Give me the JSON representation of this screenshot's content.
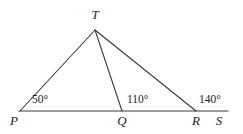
{
  "figure": {
    "type": "geometry-diagram",
    "background_color": "#ffffff",
    "stroke_color": "#3a3a3a",
    "text_color": "#1d1d1d",
    "vertices": [
      {
        "name": "T",
        "label": "T",
        "x": 95,
        "y": 30,
        "label_x": 95,
        "label_y": 14
      },
      {
        "name": "P",
        "label": "P",
        "x": 20,
        "y": 111,
        "label_x": 14,
        "label_y": 120
      },
      {
        "name": "Q",
        "label": "Q",
        "x": 122,
        "y": 111,
        "label_x": 122,
        "label_y": 120
      },
      {
        "name": "R",
        "label": "R",
        "x": 196,
        "y": 111,
        "label_x": 196,
        "label_y": 120
      },
      {
        "name": "S",
        "label": "S",
        "x": 228,
        "y": 111,
        "label_x": 219,
        "label_y": 120
      }
    ],
    "segments": [
      {
        "name": "baseline-PS",
        "from": "P",
        "to": "S",
        "x1": 19,
        "y1": 111,
        "x2": 228,
        "y2": 111
      },
      {
        "name": "segment-TP",
        "from": "T",
        "to": "P",
        "x1": 95,
        "y1": 30,
        "x2": 20,
        "y2": 111
      },
      {
        "name": "segment-TQ",
        "from": "T",
        "to": "Q",
        "x1": 95,
        "y1": 30,
        "x2": 122,
        "y2": 111
      },
      {
        "name": "segment-TR",
        "from": "T",
        "to": "R",
        "x1": 95,
        "y1": 30,
        "x2": 196,
        "y2": 111
      }
    ],
    "angles": [
      {
        "name": "angle-at-P",
        "value": "50°",
        "at_vertex": "P",
        "label_x": 32,
        "label_y": 100
      },
      {
        "name": "angle-at-Q",
        "value": "110°",
        "at_vertex": "Q",
        "label_x": 127,
        "label_y": 100
      },
      {
        "name": "angle-at-R",
        "value": "140°",
        "at_vertex": "R",
        "label_x": 199,
        "label_y": 100
      }
    ]
  }
}
